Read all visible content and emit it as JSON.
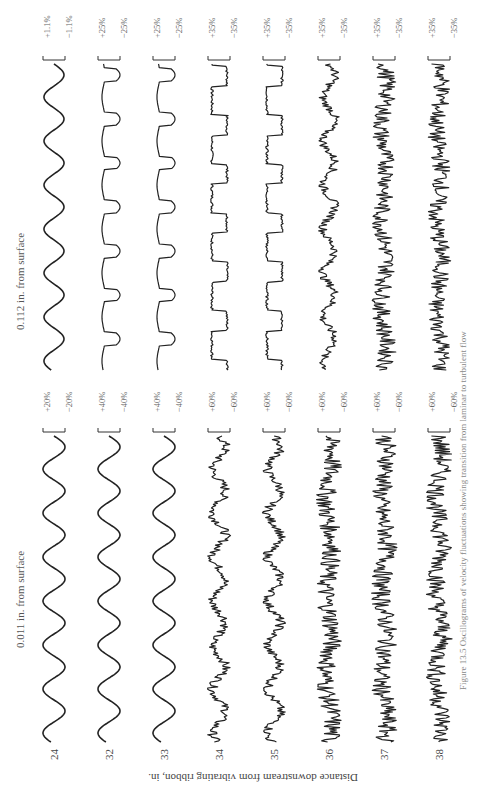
{
  "figure": {
    "caption": "Figure 13.5 Oscillograms of velocity fluctuations showing transition from laminar to turbulent flow",
    "axis_label": "Distance downstream from vibrating ribbon, in.",
    "panels": [
      {
        "title": "0.112 in. from surface",
        "scales": [
          {
            "plus": "+1.1%",
            "minus": "−1.1%"
          },
          {
            "plus": "+25%",
            "minus": "−25%"
          },
          {
            "plus": "+25%",
            "minus": "−25%"
          },
          {
            "plus": "+35%",
            "minus": "−35%"
          },
          {
            "plus": "+35%",
            "minus": "−35%"
          },
          {
            "plus": "+35%",
            "minus": "−35%"
          },
          {
            "plus": "+35%",
            "minus": "−35%"
          },
          {
            "plus": "+35%",
            "minus": "−35%"
          }
        ]
      },
      {
        "title": "0.011 in. from surface",
        "scales": [
          {
            "plus": "+20%",
            "minus": "−20%"
          },
          {
            "plus": "+40%",
            "minus": "−40%"
          },
          {
            "plus": "+40%",
            "minus": "−40%"
          },
          {
            "plus": "+60%",
            "minus": "−60%"
          },
          {
            "plus": "+60%",
            "minus": "−60%"
          },
          {
            "plus": "+60%",
            "minus": "−60%"
          },
          {
            "plus": "+60%",
            "minus": "−60%"
          },
          {
            "plus": "+60%",
            "minus": "−60%"
          }
        ]
      }
    ],
    "stations": [
      "24",
      "32",
      "33",
      "34",
      "35",
      "36",
      "37",
      "38"
    ]
  },
  "chart_data": {
    "type": "line",
    "xlabel": "time (oscillogram trace)",
    "ylabel": "velocity fluctuation, % of free-stream",
    "series_group_label": "Distance downstream from vibrating ribbon, in.",
    "panels": [
      {
        "name": "0.112 in. from surface",
        "stations": [
          "24",
          "32",
          "33",
          "34",
          "35",
          "36",
          "37",
          "38"
        ],
        "amplitude_scale_pct": [
          1.1,
          25,
          25,
          35,
          35,
          35,
          35,
          35
        ],
        "character": [
          "sinusoidal",
          "periodic with spikes",
          "periodic with spikes",
          "intermittent bursts",
          "intermittent bursts",
          "intermittent turbulent",
          "mostly turbulent",
          "fully turbulent"
        ]
      },
      {
        "name": "0.011 in. from surface",
        "stations": [
          "24",
          "32",
          "33",
          "34",
          "35",
          "36",
          "37",
          "38"
        ],
        "amplitude_scale_pct": [
          20,
          40,
          40,
          60,
          60,
          60,
          60,
          60
        ],
        "character": [
          "sinusoidal",
          "sinusoidal",
          "sinusoidal",
          "distorted with spikes",
          "irregular",
          "irregular turbulent",
          "turbulent",
          "fully turbulent"
        ]
      }
    ]
  }
}
